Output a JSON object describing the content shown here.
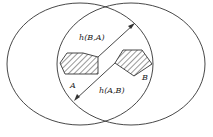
{
  "diagram": {
    "type": "hausdorff-distance-illustration",
    "labels": {
      "set_a": "A",
      "set_b": "B",
      "h_ba": "h(B,A)",
      "h_ab": "h(A,B)"
    },
    "colors": {
      "stroke": "#333333",
      "background": "#ffffff"
    }
  }
}
